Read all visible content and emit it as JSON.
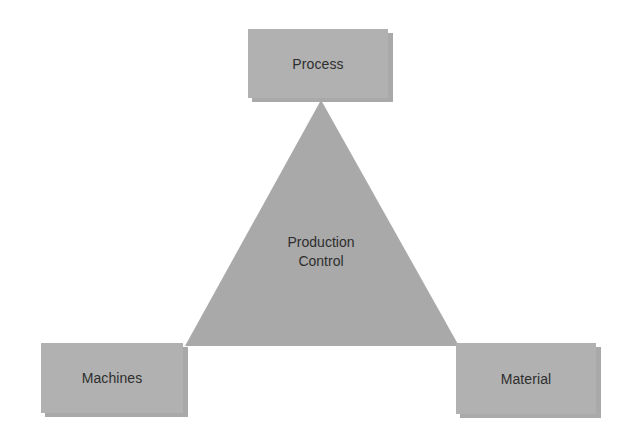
{
  "diagram": {
    "type": "triangle-relationship",
    "center": {
      "line1": "Production",
      "line2": "Control"
    },
    "nodes": {
      "top": {
        "label": "Process"
      },
      "bottom_left": {
        "label": "Machines"
      },
      "bottom_right": {
        "label": "Material"
      }
    },
    "colors": {
      "box_fill": "#b1b1b1",
      "box_shadow": "#a9a9a9",
      "triangle_fill": "#a8a8a8",
      "text": "#2e2e2e",
      "background": "#ffffff"
    }
  }
}
